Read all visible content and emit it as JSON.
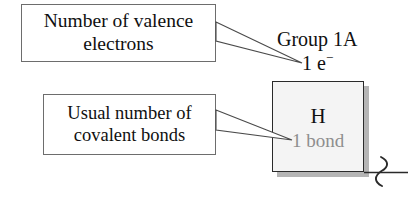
{
  "figure": {
    "type": "annotated-element-tile-diagram",
    "background_color": "#ffffff"
  },
  "callouts": [
    {
      "name": "valence-electrons",
      "line1": "Number of valence",
      "line2": "electrons",
      "points_to": "1 e⁻",
      "border_color": "#6d6d6d",
      "text_color": "#101010"
    },
    {
      "name": "covalent-bonds",
      "line1": "Usual number of",
      "line2": "covalent bonds",
      "points_to": "1 bond",
      "border_color": "#6d6d6d",
      "text_color": "#101010"
    }
  ],
  "labels": {
    "group": "Group 1A",
    "electrons_count": "1 e",
    "electrons_charge": "−"
  },
  "element_tile": {
    "symbol": "H",
    "bonds": "1 bond",
    "fill_color": "#f4f4f4",
    "border_color": "#2a2a2a",
    "symbol_color": "#101010",
    "bonds_color": "#8e8e8e",
    "shadow_color": "#787878"
  },
  "bond_stub": {
    "name": "squiggle-bond-break",
    "line_color": "#2a2a2a",
    "description": "horizontal bond line crossed by a vertical wavy break symbol"
  }
}
